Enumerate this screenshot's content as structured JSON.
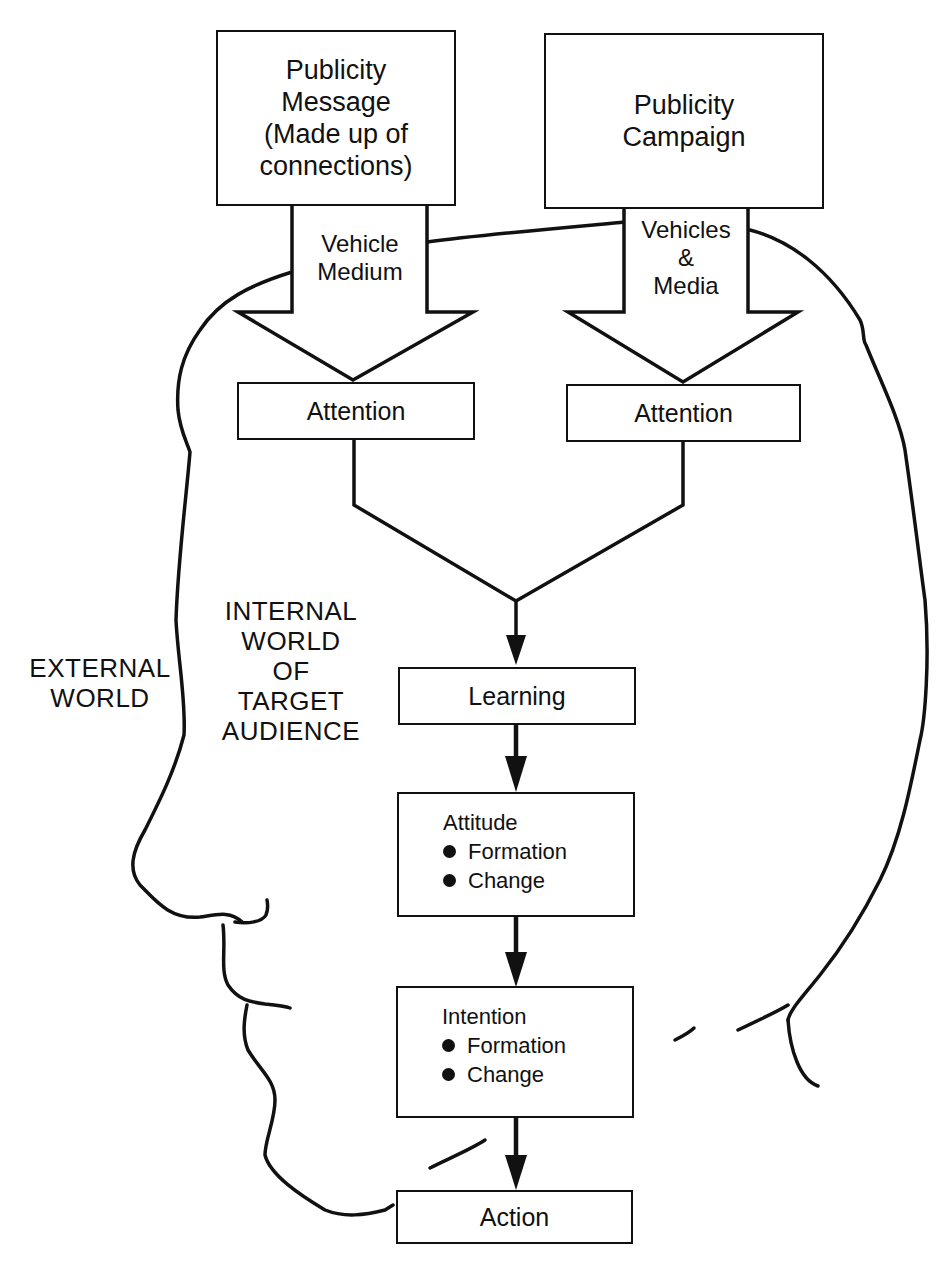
{
  "diagram": {
    "title": "",
    "sources": [
      {
        "id": "message",
        "lines": [
          "Publicity",
          "Message",
          "(Made up of",
          "connections)"
        ]
      },
      {
        "id": "campaign",
        "lines": [
          "Publicity",
          "Campaign"
        ]
      }
    ],
    "channels": [
      {
        "id": "vehicle-medium",
        "lines": [
          "Vehicle",
          "Medium"
        ]
      },
      {
        "id": "vehicles-media",
        "lines": [
          "Vehicles",
          "&",
          "Media"
        ]
      }
    ],
    "attention_boxes": [
      {
        "label": "Attention"
      },
      {
        "label": "Attention"
      }
    ],
    "learning": {
      "label": "Learning"
    },
    "attitude": {
      "title": "Attitude",
      "bullets": [
        "Formation",
        "Change"
      ]
    },
    "intention": {
      "title": "Intention",
      "bullets": [
        "Formation",
        "Change"
      ]
    },
    "action": {
      "label": "Action"
    },
    "regions": {
      "external": [
        "EXTERNAL",
        "WORLD"
      ],
      "internal": [
        "INTERNAL",
        "WORLD",
        "OF",
        "TARGET",
        "AUDIENCE"
      ]
    },
    "colors": {
      "ink": "#111111",
      "paper": "#ffffff"
    }
  }
}
